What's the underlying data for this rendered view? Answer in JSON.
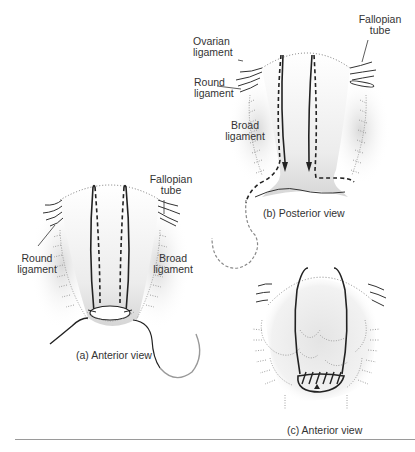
{
  "figure": {
    "panels": [
      {
        "id": "a",
        "caption": "(a) Anterior view",
        "labels": {
          "fallopian_tube": "Fallopian\ntube",
          "round_ligament": "Round\nligament",
          "broad_ligament": "Broad\nligament"
        }
      },
      {
        "id": "b",
        "caption": "(b) Posterior view",
        "labels": {
          "fallopian_tube": "Fallopian\ntube",
          "ovarian_ligament": "Ovarian\nligament",
          "round_ligament": "Round\nligament",
          "broad_ligament": "Broad\nligament"
        }
      },
      {
        "id": "c",
        "caption": "(c) Anterior view",
        "labels": {}
      }
    ],
    "colors": {
      "line": "#222222",
      "shading": "#d8d8d8",
      "dotted": "#888888",
      "label_text": "#333333",
      "needle": "#9a9a9a"
    }
  }
}
